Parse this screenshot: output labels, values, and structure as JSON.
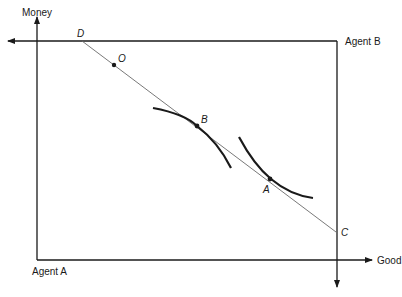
{
  "diagram": {
    "type": "edgeworth-box",
    "axes": {
      "agent_a_vertical": "Money",
      "agent_a_horizontal": "Good",
      "origin_a_label": "Agent A",
      "origin_b_label": "Agent B"
    },
    "points": {
      "D": "D",
      "O": "O",
      "B": "B",
      "A": "A",
      "C": "C"
    },
    "colors": {
      "line": "#1a1a1a",
      "budget_line": "#6a6a6a",
      "background": "#ffffff"
    }
  }
}
